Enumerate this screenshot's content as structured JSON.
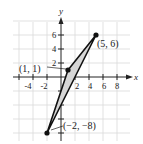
{
  "diagram": {
    "type": "coordinate-plane-triangle",
    "axes": {
      "x_label": "x",
      "y_label": "y",
      "x_ticks": [
        "-4",
        "-2",
        "2",
        "4",
        "6",
        "8"
      ],
      "y_ticks": [
        "2",
        "4",
        "6"
      ],
      "grid_step": 2,
      "x_range": [
        -6,
        10
      ],
      "y_range": [
        -10,
        8
      ]
    },
    "vertices": [
      {
        "label": "(1, 1)",
        "x": 1,
        "y": 1
      },
      {
        "label": "(5, 6)",
        "x": 5,
        "y": 6
      },
      {
        "label": "(−2, −8)",
        "x": -2,
        "y": -8
      }
    ],
    "colors": {
      "grid": "#d9d9d9",
      "axis": "#222222",
      "edge": "#111111",
      "fill": "#d6d6d6"
    }
  }
}
